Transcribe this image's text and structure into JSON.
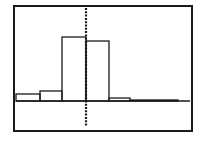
{
  "screen": {
    "background": "#ffffff",
    "ink": "#1a1a1a"
  },
  "chart_data": {
    "type": "bar",
    "title": "",
    "xlabel": "",
    "ylabel": "",
    "grid": false,
    "legend": "none",
    "bins": [
      {
        "x0": 16,
        "x1": 40,
        "height": 7
      },
      {
        "x0": 40,
        "x1": 62,
        "height": 10
      },
      {
        "x0": 62,
        "x1": 86,
        "height": 64
      },
      {
        "x0": 86,
        "x1": 109,
        "height": 60
      },
      {
        "x0": 109,
        "x1": 130,
        "height": 3
      },
      {
        "x0": 130,
        "x1": 178,
        "height": 1
      }
    ],
    "categories": [
      "bin1",
      "bin2",
      "bin3",
      "bin4",
      "bin5",
      "bin6"
    ],
    "values": [
      7,
      10,
      64,
      60,
      3,
      1
    ]
  }
}
